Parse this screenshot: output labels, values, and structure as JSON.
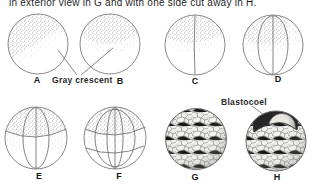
{
  "caption": "in exterior view in G and with one side cut away in H.",
  "labels": {
    "gray_crescent": "Gray crescent",
    "blastocoel": "Blastocoel"
  },
  "panels": [
    {
      "letter": "A"
    },
    {
      "letter": "B"
    },
    {
      "letter": "C"
    },
    {
      "letter": "D"
    },
    {
      "letter": "E"
    },
    {
      "letter": "F"
    },
    {
      "letter": "G"
    },
    {
      "letter": "H"
    }
  ],
  "colors": {
    "background": "#ffffff",
    "ink": "#1f1f1f",
    "stipple": "#8a8a8a",
    "outline": "#777777",
    "blastocoel_cavity": "#262626"
  }
}
